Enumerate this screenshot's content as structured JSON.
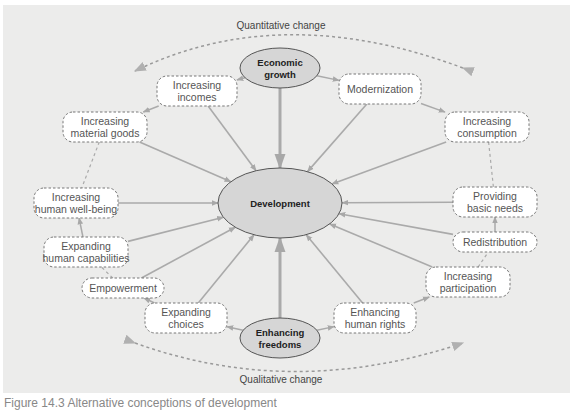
{
  "diagram": {
    "title_top": "Quantitative change",
    "title_bottom": "Qualitative change",
    "center": {
      "id": "development",
      "label": "Development"
    },
    "hubs": [
      {
        "id": "economic_growth",
        "lines": [
          "Economic",
          "growth"
        ]
      },
      {
        "id": "enhancing_freedoms",
        "lines": [
          "Enhancing",
          "freedoms"
        ]
      }
    ],
    "nodes": [
      {
        "id": "increasing_incomes",
        "lines": [
          "Increasing",
          "incomes"
        ]
      },
      {
        "id": "modernization",
        "lines": [
          "Modernization"
        ]
      },
      {
        "id": "increasing_material_goods",
        "lines": [
          "Increasing",
          "material goods"
        ]
      },
      {
        "id": "increasing_consumption",
        "lines": [
          "Increasing",
          "consumption"
        ]
      },
      {
        "id": "increasing_human_well_being",
        "lines": [
          "Increasing",
          "human well-being"
        ]
      },
      {
        "id": "providing_basic_needs",
        "lines": [
          "Providing",
          "basic needs"
        ]
      },
      {
        "id": "expanding_human_capabilities",
        "lines": [
          "Expanding",
          "human capabilities"
        ]
      },
      {
        "id": "redistribution",
        "lines": [
          "Redistribution"
        ]
      },
      {
        "id": "empowerment",
        "lines": [
          "Empowerment"
        ]
      },
      {
        "id": "increasing_participation",
        "lines": [
          "Increasing",
          "participation"
        ]
      },
      {
        "id": "expanding_choices",
        "lines": [
          "Expanding",
          "choices"
        ]
      },
      {
        "id": "enhancing_human_rights",
        "lines": [
          "Enhancing",
          "human rights"
        ]
      }
    ],
    "edges_to_center": [
      "economic_growth",
      "enhancing_freedoms",
      "increasing_incomes",
      "modernization",
      "increasing_material_goods",
      "increasing_consumption",
      "increasing_human_well_being",
      "providing_basic_needs",
      "expanding_human_capabilities",
      "redistribution",
      "empowerment",
      "increasing_participation",
      "expanding_choices",
      "enhancing_human_rights"
    ],
    "chain_edges": [
      {
        "from": "economic_growth",
        "to": "increasing_incomes"
      },
      {
        "from": "economic_growth",
        "to": "modernization"
      },
      {
        "from": "increasing_incomes",
        "to": "increasing_material_goods"
      },
      {
        "from": "modernization",
        "to": "increasing_consumption"
      },
      {
        "from": "expanding_human_capabilities",
        "to": "increasing_human_well_being"
      },
      {
        "from": "redistribution",
        "to": "providing_basic_needs"
      },
      {
        "from": "enhancing_freedoms",
        "to": "expanding_choices"
      },
      {
        "from": "enhancing_freedoms",
        "to": "enhancing_human_rights"
      },
      {
        "from": "expanding_choices",
        "to": "empowerment"
      },
      {
        "from": "enhancing_human_rights",
        "to": "increasing_participation"
      }
    ],
    "dashed_links": [
      {
        "from": "increasing_material_goods",
        "to": "increasing_human_well_being"
      },
      {
        "from": "increasing_consumption",
        "to": "providing_basic_needs"
      },
      {
        "from": "empowerment",
        "to": "expanding_human_capabilities"
      },
      {
        "from": "increasing_participation",
        "to": "redistribution"
      }
    ],
    "colors": {
      "background": "#ececeb",
      "arrow": "#aaaaaa",
      "hub_fill": "#d6d6d6",
      "node_fill": "#ffffff",
      "dashed": "#888888"
    }
  },
  "caption": "Figure 14.3  Alternative conceptions of development"
}
